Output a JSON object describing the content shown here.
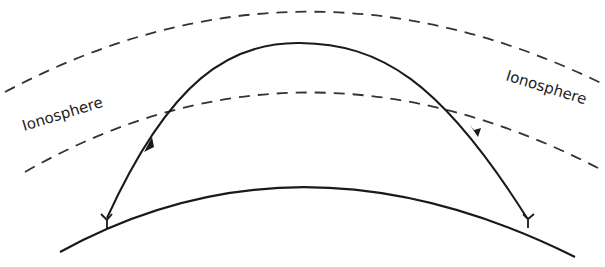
{
  "diagram": {
    "labels": {
      "left": "Ionosphere",
      "right": "Ionosphere"
    },
    "colors": {
      "line": "#1a1a1a",
      "dashed": "#333333",
      "background": "#ffffff"
    },
    "elements": [
      "outer-ionosphere-boundary",
      "inner-ionosphere-boundary",
      "radio-ray-path",
      "earth-surface",
      "transmitter-antenna",
      "receiver-antenna"
    ]
  }
}
